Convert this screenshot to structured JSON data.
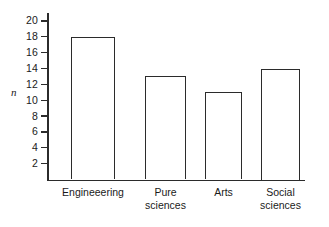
{
  "chart_data": {
    "type": "bar",
    "title": "",
    "xlabel": "",
    "ylabel": "n",
    "categories": [
      "Engineeering",
      "Pure\nsciences",
      "Arts",
      "Social\nsciences"
    ],
    "values": [
      18,
      13,
      11,
      14
    ],
    "ylim": [
      0,
      21
    ],
    "yticks": [
      2,
      4,
      6,
      8,
      10,
      12,
      14,
      16,
      18,
      20
    ],
    "ytick_labels": [
      "2",
      "4",
      "6",
      "8",
      "10",
      "12",
      "14",
      "16",
      "18",
      "20"
    ],
    "grid": false,
    "legend": false,
    "bar_style": {
      "fill": "#ffffff",
      "edge_color": "#2b2b2b"
    },
    "axis_color": "#2b2b2b",
    "background": "#ffffff"
  }
}
